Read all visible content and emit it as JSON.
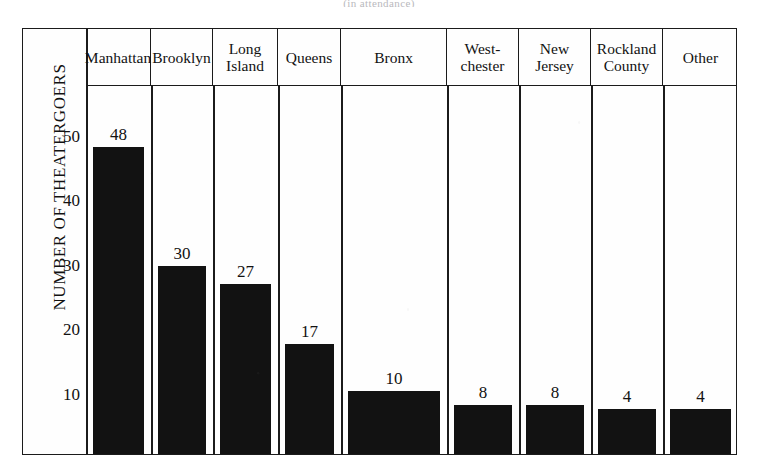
{
  "caption_remnant": "(in attendance)",
  "chart_data": {
    "type": "bar",
    "title": "",
    "xlabel": "",
    "ylabel": "NUMBER OF THEATERGOERS",
    "categories": [
      "Manhattan",
      "Brooklyn",
      "Long\nIsland",
      "Queens",
      "Bronx",
      "West-\nchester",
      "New\nJersey",
      "Rockland\nCounty",
      "Other"
    ],
    "values": [
      48,
      30,
      27,
      17,
      10,
      8,
      8,
      4,
      4
    ],
    "value_labels": [
      "48",
      "30",
      "27",
      "17",
      "10",
      "8",
      "8",
      "4",
      "4"
    ],
    "ylim": [
      0,
      55
    ],
    "yticks": [
      10,
      20,
      30,
      40,
      50
    ],
    "ytick_labels": [
      "10",
      "20",
      "30",
      "40",
      "50"
    ],
    "grid": false,
    "legend": false,
    "bar_color": "#121212",
    "frame_color": "#1b1b1b",
    "background_color": "#fefefe"
  }
}
